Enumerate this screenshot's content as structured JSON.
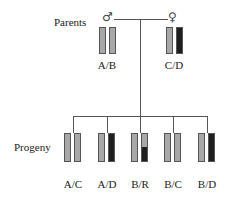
{
  "labels": {
    "parents": "Parents",
    "progeny": "Progeny"
  },
  "symbols": {
    "male": "♂",
    "female": "♀"
  },
  "colors": {
    "light": "#a8a8a8",
    "dark": "#1e1e1e",
    "line": "#555555"
  },
  "parents": [
    {
      "sex": "male",
      "genotype": "A/B",
      "chromosomes": [
        "light",
        "light"
      ]
    },
    {
      "sex": "female",
      "genotype": "C/D",
      "chromosomes": [
        "light",
        "dark"
      ]
    }
  ],
  "progeny": [
    {
      "genotype": "A/C",
      "chromosomes": [
        "light",
        "light"
      ]
    },
    {
      "genotype": "A/D",
      "chromosomes": [
        "light",
        "dark"
      ]
    },
    {
      "genotype": "B/R",
      "chromosomes": [
        "light",
        "recombinant (light top, dark bottom)"
      ]
    },
    {
      "genotype": "B/C",
      "chromosomes": [
        "light",
        "light"
      ]
    },
    {
      "genotype": "B/D",
      "chromosomes": [
        "light",
        "dark"
      ]
    }
  ]
}
